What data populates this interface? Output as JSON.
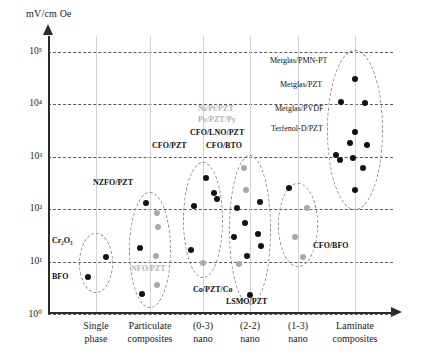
{
  "chart_data": {
    "type": "scatter",
    "title": "",
    "ylabel": "mV/cm Oe",
    "xlabel": "",
    "ylim": [
      1,
      100000
    ],
    "yscale": "log",
    "grid": true,
    "legend": false,
    "ytick_labels": [
      "10⁰",
      "10¹",
      "10²",
      "10³",
      "10⁴",
      "10⁵"
    ],
    "ytick_values": [
      1,
      10,
      100,
      1000,
      10000,
      100000
    ],
    "categories": [
      "Single phase",
      "Particulate composites",
      "(0-3) nano",
      "(2-2) nano",
      "(1-3) nano",
      "Laminate composites"
    ],
    "category_lines": [
      {
        "line1": "Single",
        "line2": "phase"
      },
      {
        "line1": "Particulate",
        "line2": "composites"
      },
      {
        "line1": "(0-3)",
        "line2": "nano"
      },
      {
        "line1": "(2-2)",
        "line2": "nano"
      },
      {
        "line1": "(1-3)",
        "line2": "nano"
      },
      {
        "line1": "Laminate",
        "line2": "composites"
      }
    ],
    "series": [
      {
        "name": "Single phase",
        "category": "Single phase",
        "points": [
          {
            "value": 12,
            "color": "black"
          },
          {
            "value": 5,
            "color": "black"
          }
        ]
      },
      {
        "name": "Particulate composites",
        "category": "Particulate composites",
        "points": [
          {
            "value": 130,
            "color": "black"
          },
          {
            "value": 85,
            "color": "gray"
          },
          {
            "value": 45,
            "color": "gray"
          },
          {
            "value": 18,
            "color": "black"
          },
          {
            "value": 13,
            "color": "gray"
          },
          {
            "value": 3.5,
            "color": "gray"
          },
          {
            "value": 2.4,
            "color": "black"
          }
        ]
      },
      {
        "name": "(0-3) nano",
        "category": "(0-3) nano",
        "points": [
          {
            "value": 400,
            "color": "black"
          },
          {
            "value": 200,
            "color": "black"
          },
          {
            "value": 160,
            "color": "black"
          },
          {
            "value": 115,
            "color": "black"
          },
          {
            "value": 17,
            "color": "black"
          },
          {
            "value": 9.5,
            "color": "gray"
          }
        ]
      },
      {
        "name": "(2-2) nano",
        "category": "(2-2) nano",
        "points": [
          {
            "value": 600,
            "color": "gray"
          },
          {
            "value": 230,
            "color": "gray"
          },
          {
            "value": 140,
            "color": "black"
          },
          {
            "value": 105,
            "color": "black"
          },
          {
            "value": 55,
            "color": "black"
          },
          {
            "value": 33,
            "color": "black"
          },
          {
            "value": 30,
            "color": "black"
          },
          {
            "value": 20,
            "color": "black"
          },
          {
            "value": 13,
            "color": "black"
          },
          {
            "value": 9,
            "color": "gray"
          },
          {
            "value": 2.3,
            "color": "black"
          }
        ]
      },
      {
        "name": "(1-3) nano",
        "category": "(1-3) nano",
        "points": [
          {
            "value": 250,
            "color": "black"
          },
          {
            "value": 105,
            "color": "gray"
          },
          {
            "value": 30,
            "color": "gray"
          },
          {
            "value": 12,
            "color": "gray"
          }
        ]
      },
      {
        "name": "Laminate composites",
        "category": "Laminate composites",
        "points": [
          {
            "value": 30000,
            "color": "black"
          },
          {
            "value": 11000,
            "color": "black"
          },
          {
            "value": 10500,
            "color": "black"
          },
          {
            "value": 3000,
            "color": "black"
          },
          {
            "value": 1800,
            "color": "black"
          },
          {
            "value": 1700,
            "color": "black"
          },
          {
            "value": 1100,
            "color": "black"
          },
          {
            "value": 950,
            "color": "black"
          },
          {
            "value": 850,
            "color": "black"
          },
          {
            "value": 600,
            "color": "black"
          },
          {
            "value": 230,
            "color": "black"
          }
        ]
      }
    ],
    "annotations": [
      {
        "text": "Cr₂O₃",
        "style": "bold",
        "x": 52,
        "y": 236
      },
      {
        "text": "BFO",
        "style": "bold",
        "x": 52,
        "y": 272
      },
      {
        "text": "NZFO/PZT",
        "style": "bold",
        "x": 93,
        "y": 178
      },
      {
        "text": "NFO/PZT",
        "style": "faint",
        "x": 131,
        "y": 264
      },
      {
        "text": "CFO/PZT",
        "style": "bold",
        "x": 152,
        "y": 141
      },
      {
        "text": "CFO/BTO",
        "style": "bold",
        "x": 206,
        "y": 141
      },
      {
        "text": "CFO/LNO/PZT",
        "style": "bold",
        "x": 190,
        "y": 128
      },
      {
        "text": "Ni/Pt/PZT",
        "style": "faint",
        "x": 198,
        "y": 104
      },
      {
        "text": "Py/PZT/Py",
        "style": "faint",
        "x": 198,
        "y": 115
      },
      {
        "text": "Co/PZT/Co",
        "style": "bold",
        "x": 193,
        "y": 285
      },
      {
        "text": "LSMO/PZT",
        "style": "bold",
        "x": 226,
        "y": 297
      },
      {
        "text": "CFO/BFO",
        "style": "bold",
        "x": 313,
        "y": 241
      },
      {
        "text": "Metglas/PMN-PT",
        "style": "plain",
        "x": 270,
        "y": 56
      },
      {
        "text": "Metglas/PZT",
        "style": "plain",
        "x": 280,
        "y": 80
      },
      {
        "text": "Metglas/PVDF",
        "style": "plain",
        "x": 275,
        "y": 104
      },
      {
        "text": "Terfenol-D/PZT",
        "style": "plain",
        "x": 271,
        "y": 124
      }
    ],
    "clusters": [
      {
        "name": "Single phase",
        "cx": 96,
        "cy": 263,
        "rx": 17,
        "ry": 30
      },
      {
        "name": "Particulate composites",
        "cx": 150,
        "cy": 250,
        "rx": 21,
        "ry": 58
      },
      {
        "name": "(0-3) nano",
        "cx": 203,
        "cy": 220,
        "rx": 20,
        "ry": 58
      },
      {
        "name": "(2-2) nano",
        "cx": 250,
        "cy": 230,
        "rx": 21,
        "ry": 75
      },
      {
        "name": "(1-3) nano",
        "cx": 298,
        "cy": 225,
        "rx": 20,
        "ry": 42
      },
      {
        "name": "Laminate composites",
        "cx": 355,
        "cy": 130,
        "rx": 28,
        "ry": 80
      }
    ]
  }
}
